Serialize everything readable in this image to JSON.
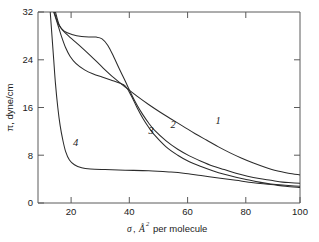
{
  "chart_data": {
    "type": "line",
    "title": "",
    "xlabel": "σ, Å² per molecule",
    "xlabel_parts": {
      "symbol": "σ",
      "comma": ",",
      "unit": "Å",
      "superscript": "2",
      "suffix": "per molecule"
    },
    "ylabel": "π, dyne/cm",
    "xlim": [
      10,
      100
    ],
    "ylim": [
      0,
      32
    ],
    "xticks": [
      20,
      40,
      60,
      80,
      100
    ],
    "xticklabels": [
      "20",
      "40",
      "60",
      "80",
      "100"
    ],
    "yticks": [
      0,
      8,
      16,
      24,
      32
    ],
    "yticklabels": [
      "0",
      "8",
      "16",
      "24",
      "32"
    ],
    "grid": false,
    "legend": "inline-curve-labels",
    "curve_label_positions": [
      {
        "name": "1",
        "x": 71,
        "y": 13.2
      },
      {
        "name": "2",
        "x": 55.5,
        "y": 12.6
      },
      {
        "name": "3",
        "x": 48.0,
        "y": 11.5
      },
      {
        "name": "4",
        "x": 22.0,
        "y": 9.6
      }
    ],
    "series": [
      {
        "name": "1",
        "label": "1",
        "points": [
          [
            16.0,
            32.0
          ],
          [
            17.5,
            29.6
          ],
          [
            20.0,
            28.2
          ],
          [
            24.0,
            26.5
          ],
          [
            28.0,
            24.7
          ],
          [
            32.0,
            22.8
          ],
          [
            36.0,
            21.0
          ],
          [
            40.0,
            19.4
          ],
          [
            44.0,
            17.9
          ],
          [
            48.0,
            16.5
          ],
          [
            52.0,
            15.2
          ],
          [
            56.0,
            14.0
          ],
          [
            60.0,
            12.8
          ],
          [
            64.0,
            11.6
          ],
          [
            68.0,
            10.5
          ],
          [
            72.0,
            9.4
          ],
          [
            76.0,
            8.4
          ],
          [
            80.0,
            7.5
          ],
          [
            84.0,
            6.7
          ],
          [
            88.0,
            6.0
          ],
          [
            92.0,
            5.4
          ],
          [
            96.0,
            5.0
          ],
          [
            100.0,
            4.7
          ]
        ]
      },
      {
        "name": "2",
        "label": "2",
        "points": [
          [
            15.6,
            32.0
          ],
          [
            17.0,
            30.0
          ],
          [
            19.0,
            28.8
          ],
          [
            22.0,
            28.2
          ],
          [
            25.0,
            27.9
          ],
          [
            27.5,
            27.8
          ],
          [
            30.0,
            27.8
          ],
          [
            32.0,
            27.5
          ],
          [
            34.0,
            26.4
          ],
          [
            36.0,
            24.5
          ],
          [
            38.0,
            22.4
          ],
          [
            40.0,
            20.4
          ],
          [
            42.0,
            18.3
          ],
          [
            44.0,
            16.4
          ],
          [
            46.0,
            14.8
          ],
          [
            48.0,
            13.4
          ],
          [
            50.0,
            12.2
          ],
          [
            54.0,
            10.4
          ],
          [
            58.0,
            9.0
          ],
          [
            62.0,
            7.9
          ],
          [
            66.0,
            7.0
          ],
          [
            70.0,
            6.2
          ],
          [
            74.0,
            5.6
          ],
          [
            78.0,
            5.0
          ],
          [
            82.0,
            4.5
          ],
          [
            86.0,
            4.1
          ],
          [
            90.0,
            3.8
          ],
          [
            94.0,
            3.5
          ],
          [
            97.0,
            3.4
          ],
          [
            100.0,
            3.3
          ]
        ]
      },
      {
        "name": "3",
        "label": "3",
        "points": [
          [
            15.4,
            32.0
          ],
          [
            16.6,
            30.2
          ],
          [
            18.0,
            28.0
          ],
          [
            19.5,
            26.0
          ],
          [
            21.0,
            24.6
          ],
          [
            23.0,
            23.4
          ],
          [
            26.0,
            22.3
          ],
          [
            29.0,
            21.6
          ],
          [
            32.0,
            21.1
          ],
          [
            35.0,
            20.6
          ],
          [
            38.0,
            20.1
          ],
          [
            40.0,
            19.6
          ],
          [
            42.0,
            18.0
          ],
          [
            44.0,
            16.0
          ],
          [
            46.0,
            14.2
          ],
          [
            48.0,
            12.7
          ],
          [
            50.0,
            11.4
          ],
          [
            54.0,
            9.4
          ],
          [
            58.0,
            8.0
          ],
          [
            62.0,
            6.9
          ],
          [
            66.0,
            6.1
          ],
          [
            70.0,
            5.4
          ],
          [
            74.0,
            4.8
          ],
          [
            78.0,
            4.3
          ],
          [
            82.0,
            3.9
          ],
          [
            86.0,
            3.5
          ],
          [
            90.0,
            3.2
          ],
          [
            94.0,
            3.0
          ],
          [
            97.0,
            2.9
          ],
          [
            100.0,
            2.8
          ]
        ]
      },
      {
        "name": "4",
        "label": "4",
        "points": [
          [
            14.2,
            32.0
          ],
          [
            14.8,
            28.0
          ],
          [
            15.4,
            24.0
          ],
          [
            16.0,
            20.0
          ],
          [
            16.8,
            16.0
          ],
          [
            17.6,
            13.0
          ],
          [
            18.5,
            10.6
          ],
          [
            19.5,
            8.6
          ],
          [
            20.8,
            7.2
          ],
          [
            22.5,
            6.4
          ],
          [
            25.0,
            5.9
          ],
          [
            28.0,
            5.7
          ],
          [
            33.0,
            5.6
          ],
          [
            40.0,
            5.5
          ],
          [
            48.0,
            5.4
          ],
          [
            55.0,
            5.2
          ],
          [
            60.0,
            5.0
          ],
          [
            66.0,
            4.6
          ],
          [
            72.0,
            4.2
          ],
          [
            78.0,
            3.8
          ],
          [
            84.0,
            3.4
          ],
          [
            90.0,
            3.1
          ],
          [
            95.0,
            2.8
          ],
          [
            100.0,
            2.6
          ]
        ]
      }
    ]
  },
  "axes": {
    "y_axis_name": "pi-dyne-per-cm",
    "x_axis_name": "sigma-angstrom-squared-per-molecule"
  }
}
